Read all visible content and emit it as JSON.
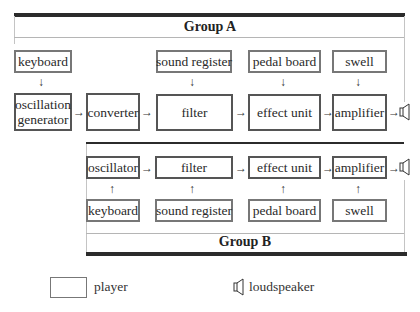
{
  "group_a": {
    "title": "Group A",
    "players": [
      {
        "id": "keyboard",
        "label": "keyboard"
      },
      {
        "id": "sound-register",
        "label": "sound register"
      },
      {
        "id": "pedal-board",
        "label": "pedal board"
      },
      {
        "id": "swell",
        "label": "swell"
      }
    ],
    "chain": [
      {
        "id": "oscillation-generator",
        "label_line1": "oscillation",
        "label_line2": "generator"
      },
      {
        "id": "converter",
        "label": "converter"
      },
      {
        "id": "filter",
        "label": "filter"
      },
      {
        "id": "effect-unit",
        "label": "effect unit"
      },
      {
        "id": "amplifier",
        "label": "amplifier"
      }
    ],
    "output": "loudspeaker"
  },
  "group_b": {
    "title": "Group B",
    "chain": [
      {
        "id": "oscillator",
        "label": "oscillator"
      },
      {
        "id": "filter",
        "label": "filter"
      },
      {
        "id": "effect-unit",
        "label": "effect unit"
      },
      {
        "id": "amplifier",
        "label": "amplifier"
      }
    ],
    "players": [
      {
        "id": "keyboard",
        "label": "keyboard"
      },
      {
        "id": "sound-register",
        "label": "sound register"
      },
      {
        "id": "pedal-board",
        "label": "pedal board"
      },
      {
        "id": "swell",
        "label": "swell"
      }
    ],
    "output": "loudspeaker"
  },
  "arrows": {
    "right": "→",
    "down": "↓",
    "up": "↑"
  },
  "legend": {
    "player_label": "player",
    "loudspeaker_label": "loudspeaker"
  },
  "colors": {
    "thick_rule": "#2b2b2b",
    "box_border": "#555555",
    "thin_rule": "#b5b5b5"
  }
}
